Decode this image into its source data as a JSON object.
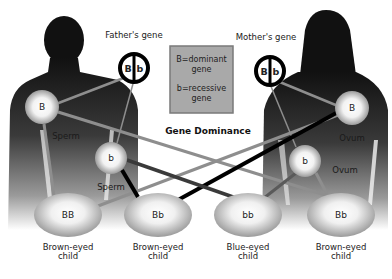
{
  "title": "Gene Dominance",
  "legend": {
    "line1": "B=dominant",
    "line2": "gene",
    "line3": "b=recessive",
    "line4": "gene",
    "fill": "#a9a9a9",
    "border": "#7a7a7a"
  },
  "parents": {
    "father": {
      "label": "Father's gene",
      "alleles": [
        "B",
        "b"
      ]
    },
    "mother": {
      "label": "Mother's gene",
      "alleles": [
        "B",
        "b"
      ]
    }
  },
  "gametes": {
    "sperm_B": {
      "allele": "B",
      "label": "Sperm"
    },
    "sperm_b": {
      "allele": "b",
      "label": "Sperm"
    },
    "ovum_B": {
      "allele": "B",
      "label": "Ovum"
    },
    "ovum_b": {
      "allele": "b",
      "label": "Ovum"
    }
  },
  "children": [
    {
      "genotype": "BB",
      "label_line1": "Brown-eyed",
      "label_line2": "child"
    },
    {
      "genotype": "Bb",
      "label_line1": "Brown-eyed",
      "label_line2": "child"
    },
    {
      "genotype": "bb",
      "label_line1": "Blue-eyed",
      "label_line2": "child"
    },
    {
      "genotype": "Bb",
      "label_line1": "Brown-eyed",
      "label_line2": "child"
    }
  ],
  "colors": {
    "silhouette": "#111111",
    "line_gray": "#8e8e8e",
    "line_dark": "#3a3a3a",
    "line_black": "#000000"
  }
}
